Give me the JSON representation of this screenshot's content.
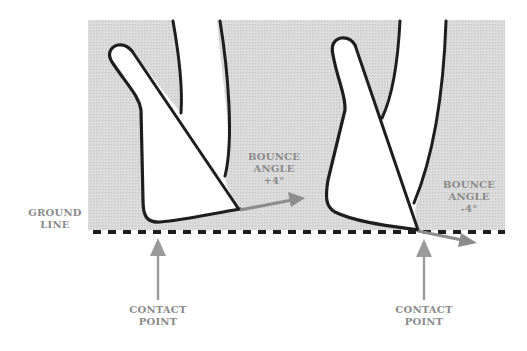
{
  "diagram": {
    "type": "golf club sole bounce angle illustration",
    "colors": {
      "background": "#ffffff",
      "panel": "#d6d6d6",
      "outline": "#1e1e1e",
      "club_fill": "#ffffff",
      "arrow": "#8c8c8c",
      "label_text": "#8a8a8a",
      "ground_line": "#1e1e1e"
    },
    "ground_label": {
      "line1": "GROUND",
      "line2": "LINE"
    },
    "clubs": [
      {
        "name": "left-club",
        "bounce_label": {
          "line1": "BOUNCE",
          "line2": "ANGLE",
          "line3": "+4°"
        },
        "contact_label": {
          "line1": "CONTACT",
          "line2": "POINT"
        }
      },
      {
        "name": "right-club",
        "bounce_label": {
          "line1": "BOUNCE",
          "line2": "ANGLE",
          "line3": "-4°"
        },
        "contact_label": {
          "line1": "CONTACT",
          "line2": "POINT"
        }
      }
    ]
  }
}
